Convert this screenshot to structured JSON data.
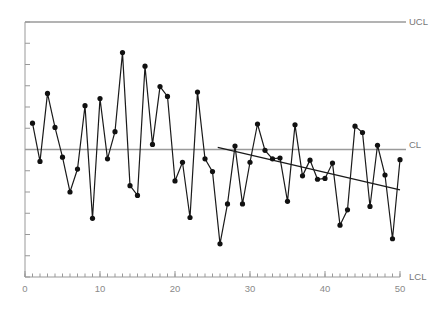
{
  "chart_data": {
    "type": "line",
    "title": "",
    "subtitle": "",
    "xlabel": "",
    "ylabel": "",
    "xlim": [
      0,
      50
    ],
    "ylim": [
      -3.2,
      3.2
    ],
    "grid": false,
    "legend_position": "right-inline",
    "xticks": [
      0,
      10,
      20,
      30,
      40,
      50
    ],
    "xtick_labels": [
      "0",
      "10",
      "20",
      "30",
      "40",
      "50"
    ],
    "xminor_tick_step": 1,
    "yticks": [
      -3,
      -2.5,
      -2,
      -1.5,
      -1,
      -0.5,
      0,
      0.5,
      1,
      1.5,
      2,
      2.5,
      3
    ],
    "ytick_labels": [],
    "x": [
      1,
      2,
      3,
      4,
      5,
      6,
      7,
      8,
      9,
      10,
      11,
      12,
      13,
      14,
      15,
      16,
      17,
      18,
      19,
      20,
      21,
      22,
      23,
      24,
      25,
      26,
      27,
      28,
      29,
      30,
      31,
      32,
      33,
      34,
      35,
      36,
      37,
      38,
      39,
      40,
      41,
      42,
      43,
      44,
      45,
      46,
      47,
      48,
      49,
      50
    ],
    "series": [
      {
        "name": "observations",
        "marker": "circle",
        "color": "#1a1a1a",
        "values": [
          0.62,
          -0.28,
          1.32,
          0.52,
          -0.18,
          -1.0,
          -0.46,
          1.03,
          -1.62,
          1.2,
          -0.22,
          0.42,
          2.28,
          -0.85,
          -1.08,
          1.96,
          0.12,
          1.48,
          1.25,
          -0.74,
          -0.3,
          -1.6,
          1.35,
          -0.22,
          -0.52,
          -2.22,
          -1.28,
          0.08,
          -1.28,
          -0.3,
          0.6,
          -0.02,
          -0.22,
          -0.2,
          -1.22,
          0.58,
          -0.62,
          -0.25,
          -0.7,
          -0.68,
          -0.32,
          -1.78,
          -1.42,
          0.55,
          0.4,
          -1.34,
          0.1,
          -0.6,
          -2.1,
          -0.24
        ]
      }
    ],
    "reference_lines": [
      {
        "name": "UCL",
        "label": "UCL",
        "value": 3.0,
        "color": "#9a9a9a",
        "x_from": 0,
        "x_to": 50
      },
      {
        "name": "CL",
        "label": "CL",
        "value": 0.0,
        "color": "#9a9a9a",
        "x_from": 0,
        "x_to": 50
      },
      {
        "name": "LCL",
        "label": "LCL",
        "value": -3.0,
        "color": "#9a9a9a",
        "x_from": 0,
        "x_to": 50
      }
    ],
    "trend_line": {
      "name": "trend",
      "label": "",
      "color": "#1a1a1a",
      "x_from": 25.7,
      "y_from": 0.05,
      "x_to": 50.0,
      "y_to": -0.95
    },
    "annotations": []
  },
  "labels": {
    "ucl": "UCL",
    "cl": "CL",
    "lcl": "LCL"
  },
  "axis": {
    "x_tick_0": "0",
    "x_tick_10": "10",
    "x_tick_20": "20",
    "x_tick_30": "30",
    "x_tick_40": "40",
    "x_tick_50": "50"
  },
  "colors": {
    "reference_line": "#9a9a9a",
    "axis": "#999999",
    "data_line": "#1a1a1a",
    "marker": "#111111",
    "background": "#ffffff",
    "tick_label": "#8a8a8a"
  }
}
